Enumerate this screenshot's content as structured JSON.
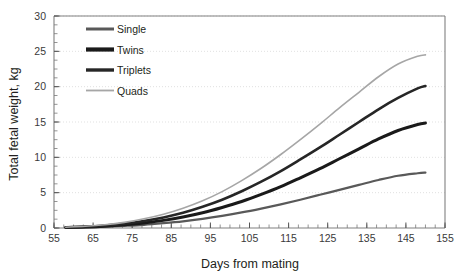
{
  "chart_data": {
    "type": "line",
    "title": "",
    "xlabel": "Days from mating",
    "ylabel": "Total fetal weight, kg",
    "xlim": [
      55,
      155
    ],
    "ylim": [
      0,
      30
    ],
    "xticks": [
      55,
      65,
      75,
      85,
      95,
      105,
      115,
      125,
      135,
      145,
      155
    ],
    "yticks": [
      0,
      5,
      10,
      15,
      20,
      25,
      30
    ],
    "x_minor_tick_step": 2.5,
    "y_minor_tick_step": 1.25,
    "grid": "horizontal-dotted",
    "grid_color": "#d9d9d9",
    "legend_position": "top-left-inside",
    "x": [
      58,
      63,
      68,
      73,
      78,
      83,
      88,
      93,
      98,
      103,
      108,
      113,
      118,
      123,
      128,
      133,
      138,
      143,
      148,
      150
    ],
    "series": [
      {
        "name": "Single",
        "color": "#595959",
        "width": 2.2,
        "values": [
          0.05,
          0.1,
          0.18,
          0.3,
          0.45,
          0.68,
          0.95,
          1.3,
          1.72,
          2.2,
          2.75,
          3.35,
          4.0,
          4.7,
          5.4,
          6.1,
          6.8,
          7.4,
          7.75,
          7.85
        ]
      },
      {
        "name": "Twins",
        "color": "#1a1a1a",
        "width": 3.0,
        "values": [
          0.07,
          0.14,
          0.26,
          0.45,
          0.72,
          1.08,
          1.55,
          2.15,
          2.9,
          3.75,
          4.75,
          5.85,
          7.1,
          8.4,
          9.8,
          11.2,
          12.6,
          13.8,
          14.65,
          14.85
        ]
      },
      {
        "name": "Triplets",
        "color": "#262626",
        "width": 2.6,
        "values": [
          0.09,
          0.19,
          0.36,
          0.62,
          1.0,
          1.5,
          2.15,
          3.0,
          4.0,
          5.2,
          6.55,
          8.05,
          9.7,
          11.4,
          13.2,
          15.0,
          16.8,
          18.4,
          19.75,
          20.1
        ]
      },
      {
        "name": "Quads",
        "color": "#a6a6a6",
        "width": 1.6,
        "values": [
          0.11,
          0.24,
          0.46,
          0.8,
          1.3,
          1.95,
          2.8,
          3.85,
          5.15,
          6.7,
          8.45,
          10.4,
          12.5,
          14.7,
          17.0,
          19.2,
          21.4,
          23.2,
          24.3,
          24.5
        ]
      }
    ],
    "legend": [
      {
        "label": "Single",
        "color": "#595959",
        "width": 3.0
      },
      {
        "label": "Twins",
        "color": "#1a1a1a",
        "width": 4.2
      },
      {
        "label": "Triplets",
        "color": "#262626",
        "width": 3.4
      },
      {
        "label": "Quads",
        "color": "#a6a6a6",
        "width": 1.8
      }
    ]
  }
}
